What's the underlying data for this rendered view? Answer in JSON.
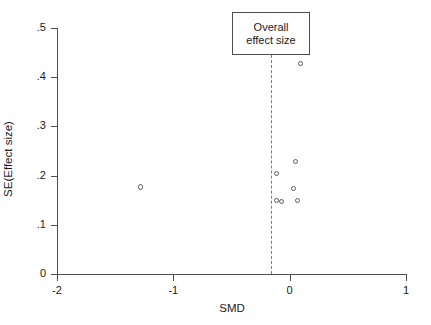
{
  "chart_data": {
    "type": "scatter",
    "title": "",
    "subtitle": "",
    "xlabel": "SMD",
    "ylabel": "SE(Effect size)",
    "xlim": [
      -2,
      1
    ],
    "ylim": [
      0,
      0.5
    ],
    "xticks": [
      -2,
      -1,
      0,
      1
    ],
    "xticklabels": [
      "-2",
      "-1",
      "0",
      "1"
    ],
    "yticks": [
      0,
      0.1,
      0.2,
      0.3,
      0.4,
      0.5
    ],
    "yticklabels": [
      "0",
      ".1",
      ".2",
      ".3",
      ".4",
      ".5"
    ],
    "grid": false,
    "legend": null,
    "y_axis_inverted": false,
    "marker": "open-circle",
    "marker_color": "#5a5a5a",
    "points": [
      {
        "x": -1.28,
        "y": 0.177
      },
      {
        "x": -0.11,
        "y": 0.204
      },
      {
        "x": -0.11,
        "y": 0.149
      },
      {
        "x": -0.07,
        "y": 0.147
      },
      {
        "x": 0.03,
        "y": 0.174
      },
      {
        "x": 0.05,
        "y": 0.228
      },
      {
        "x": 0.07,
        "y": 0.149
      },
      {
        "x": 0.09,
        "y": 0.428
      }
    ],
    "annotations": [
      {
        "name": "overall-effect-size",
        "label_line1": "Overall",
        "label_line2": "effect size",
        "reference_line_x": -0.16,
        "reference_line_style": "dashed",
        "reference_line_color": "#7a7a7a"
      }
    ]
  },
  "axes": {
    "x": {
      "label": "SMD",
      "ticks": [
        {
          "value": -2,
          "label": "-2"
        },
        {
          "value": -1,
          "label": "-1"
        },
        {
          "value": 0,
          "label": "0"
        },
        {
          "value": 1,
          "label": "1"
        }
      ]
    },
    "y": {
      "label": "SE(Effect size)",
      "ticks": [
        {
          "value": 0.5,
          "label": ".5"
        },
        {
          "value": 0.4,
          "label": ".4"
        },
        {
          "value": 0.3,
          "label": ".3"
        },
        {
          "value": 0.2,
          "label": ".2"
        },
        {
          "value": 0.1,
          "label": ".1"
        },
        {
          "value": 0.0,
          "label": "0"
        }
      ]
    }
  },
  "annotation": {
    "line1": "Overall",
    "line2": "effect size"
  },
  "colors": {
    "axis": "#4d4d4d",
    "text": "#1a1a1a",
    "marker": "#5a5a5a",
    "reference_line": "#7a7a7a",
    "background": "#ffffff"
  }
}
